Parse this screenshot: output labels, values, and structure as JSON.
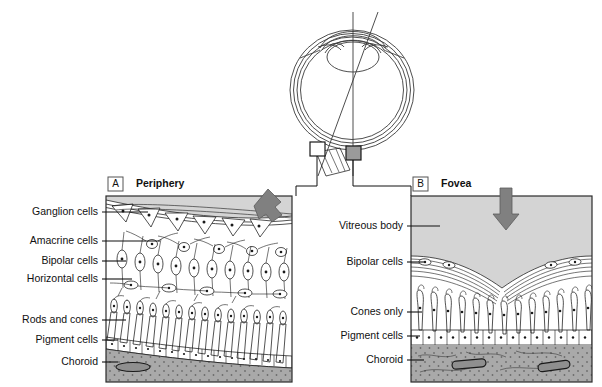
{
  "figure": {
    "type": "anatomical-diagram",
    "background_color": "#ffffff"
  },
  "colors": {
    "vitreous_gray": "#d4d4d4",
    "choroid_gray": "#a9a9a9",
    "arrow_gray": "#808080",
    "pigment_fill": "#ececec",
    "ink": "#1a1a1a",
    "frame": "#2b2b2b"
  },
  "eye_diagram": {
    "name": "eye-cross-section",
    "markers": [
      {
        "id": "periphery-marker",
        "label": ""
      },
      {
        "id": "fovea-marker",
        "label": ""
      }
    ]
  },
  "panels": [
    {
      "id": "panel-a",
      "letter": "A",
      "title": "Periphery",
      "arrow": {
        "name": "light-direction-arrow",
        "direction": "down-left"
      },
      "labels": [
        {
          "id": "ganglion-cells",
          "text": "Ganglion cells",
          "y": 212
        },
        {
          "id": "amacrine-cells",
          "text": "Amacrine cells",
          "y": 241
        },
        {
          "id": "bipolar-cells",
          "text": "Bipolar cells",
          "y": 261
        },
        {
          "id": "horizontal-cells",
          "text": "Horizontal cells",
          "y": 279
        },
        {
          "id": "rods-and-cones",
          "text": "Rods and cones",
          "y": 320
        },
        {
          "id": "pigment-cells",
          "text": "Pigment cells",
          "y": 340
        },
        {
          "id": "choroid",
          "text": "Choroid",
          "y": 362
        }
      ]
    },
    {
      "id": "panel-b",
      "letter": "B",
      "title": "Fovea",
      "arrow": {
        "name": "light-direction-arrow",
        "direction": "down"
      },
      "labels": [
        {
          "id": "vitreous-body",
          "text": "Vitreous body",
          "y": 226
        },
        {
          "id": "bipolar-cells",
          "text": "Bipolar cells",
          "y": 262
        },
        {
          "id": "cones-only",
          "text": "Cones only",
          "y": 312
        },
        {
          "id": "pigment-cells",
          "text": "Pigment cells",
          "y": 336
        },
        {
          "id": "choroid",
          "text": "Choroid",
          "y": 360
        }
      ]
    }
  ]
}
